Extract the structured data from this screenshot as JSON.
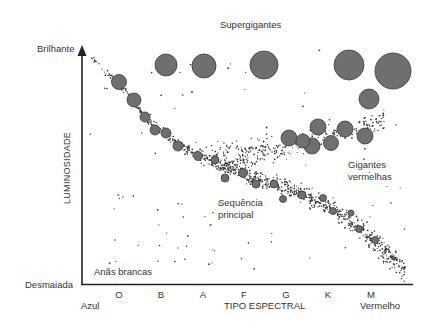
{
  "chart_data": {
    "type": "scatter",
    "title": "",
    "xlabel": "TIPO ESPECTRAL",
    "ylabel": "LUMINOSIDADE",
    "x_ticks": [
      "O",
      "B",
      "A",
      "F",
      "G",
      "K",
      "M"
    ],
    "x_ends": {
      "left": "Azul",
      "right": "Vermelho"
    },
    "y_ends": {
      "top": "Brilhante",
      "bottom": "Desmaiada"
    },
    "regions": [
      {
        "name": "Supergigantes"
      },
      {
        "name": "Gigantes vermelhas"
      },
      {
        "name": "Sequência principal"
      },
      {
        "name": "Anãs brancas"
      }
    ],
    "supergiants": [
      {
        "x": 166,
        "y": 65,
        "r": 11
      },
      {
        "x": 204,
        "y": 66,
        "r": 12
      },
      {
        "x": 264,
        "y": 65,
        "r": 14
      },
      {
        "x": 349,
        "y": 65,
        "r": 15
      },
      {
        "x": 393,
        "y": 71,
        "r": 18
      },
      {
        "x": 369,
        "y": 99,
        "r": 10
      }
    ],
    "red_giants": [
      {
        "x": 289,
        "y": 138,
        "r": 8
      },
      {
        "x": 318,
        "y": 127,
        "r": 8
      },
      {
        "x": 345,
        "y": 129,
        "r": 8
      },
      {
        "x": 365,
        "y": 136,
        "r": 8
      },
      {
        "x": 312,
        "y": 146,
        "r": 8
      },
      {
        "x": 331,
        "y": 143,
        "r": 7.5
      },
      {
        "x": 303,
        "y": 141,
        "r": 7
      }
    ],
    "main_sequence_large": [
      {
        "x": 119,
        "y": 82,
        "r": 7.5
      },
      {
        "x": 134,
        "y": 100,
        "r": 7
      },
      {
        "x": 145,
        "y": 117,
        "r": 5
      },
      {
        "x": 155,
        "y": 130,
        "r": 5
      },
      {
        "x": 166,
        "y": 133,
        "r": 5
      },
      {
        "x": 178,
        "y": 146,
        "r": 5
      },
      {
        "x": 198,
        "y": 156,
        "r": 4.5
      },
      {
        "x": 215,
        "y": 160,
        "r": 4
      },
      {
        "x": 225,
        "y": 178,
        "r": 4
      },
      {
        "x": 243,
        "y": 173,
        "r": 4.5
      },
      {
        "x": 256,
        "y": 184,
        "r": 4
      },
      {
        "x": 274,
        "y": 184,
        "r": 4
      },
      {
        "x": 283,
        "y": 199,
        "r": 3.5
      },
      {
        "x": 302,
        "y": 195,
        "r": 4
      },
      {
        "x": 323,
        "y": 198,
        "r": 3.5
      },
      {
        "x": 333,
        "y": 211,
        "r": 3.5
      },
      {
        "x": 351,
        "y": 213,
        "r": 3
      },
      {
        "x": 359,
        "y": 229,
        "r": 3.5
      },
      {
        "x": 375,
        "y": 240,
        "r": 3.5
      }
    ]
  },
  "labels": {
    "supergiants": "Supergigantes",
    "red_giants_1": "Gigantes",
    "red_giants_2": "vermelhas",
    "main_seq_1": "Sequência",
    "main_seq_2": "principal",
    "white_dwarfs": "Anãs brancas",
    "y_top": "Brilhante",
    "y_bottom": "Desmaiada",
    "y_axis": "LUMINOSIDADE",
    "x_left": "Azul",
    "x_right": "Vermelho",
    "x_axis": "TIPO ESPECTRAL",
    "ticks": [
      "O",
      "B",
      "A",
      "F",
      "G",
      "K",
      "M"
    ]
  },
  "colors": {
    "star": "#6f6f6f",
    "star_edge": "#3a3a3a",
    "dot": "#333333",
    "axis": "#222222"
  }
}
